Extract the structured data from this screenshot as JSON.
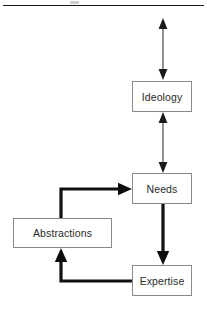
{
  "figure": {
    "title_rule": "horizontal-rule",
    "background_color": "#ffffff",
    "box_border_color": "#8a8a8a",
    "thin_arrow_color": "#3a3a3a",
    "thick_arrow_color": "#111111",
    "text_color": "#2b2b2b"
  },
  "nodes": [
    {
      "id": "ideology",
      "label": "Ideology"
    },
    {
      "id": "needs",
      "label": "Needs"
    },
    {
      "id": "abstractions",
      "label": "Abstractions"
    },
    {
      "id": "expertise",
      "label": "Expertise"
    }
  ],
  "edges": [
    {
      "id": "top-external",
      "from": "",
      "to": "ideology",
      "style": "thin",
      "heads": "double",
      "label": ""
    },
    {
      "id": "ideology-needs",
      "from": "ideology",
      "to": "needs",
      "style": "thin",
      "heads": "double",
      "label": ""
    },
    {
      "id": "needs-expertise",
      "from": "needs",
      "to": "expertise",
      "style": "thick",
      "heads": "single",
      "label": ""
    },
    {
      "id": "expertise-abstractions",
      "from": "expertise",
      "to": "abstractions",
      "style": "thick",
      "heads": "single",
      "label": ""
    },
    {
      "id": "abstractions-needs",
      "from": "abstractions",
      "to": "needs",
      "style": "thick",
      "heads": "single",
      "label": ""
    }
  ]
}
